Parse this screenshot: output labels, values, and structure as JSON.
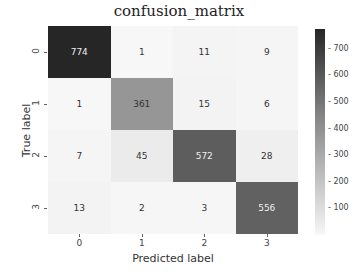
{
  "chart_data": {
    "type": "heatmap",
    "title": "confusion_matrix",
    "xlabel": "Predicted label",
    "ylabel": "True label",
    "x_tick_labels": [
      "0",
      "1",
      "2",
      "3"
    ],
    "y_tick_labels": [
      "0",
      "1",
      "2",
      "3"
    ],
    "matrix": [
      [
        774,
        1,
        11,
        9
      ],
      [
        1,
        361,
        15,
        6
      ],
      [
        7,
        45,
        572,
        28
      ],
      [
        13,
        2,
        3,
        556
      ]
    ],
    "colorbar": {
      "ticks": [
        100,
        200,
        300,
        400,
        500,
        600,
        700
      ],
      "range": [
        0,
        774
      ],
      "colormap": "greys"
    },
    "legend_position": "right"
  }
}
